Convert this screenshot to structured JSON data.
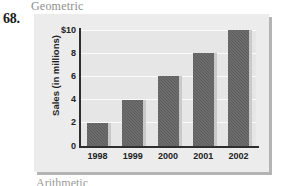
{
  "page": {
    "header_word": "Geometric",
    "footer_word": "Arithmetic",
    "problem_number": "68."
  },
  "chart_data": {
    "type": "bar",
    "title": "",
    "xlabel": "",
    "ylabel": "Sales (in millions)",
    "categories": [
      "1998",
      "1999",
      "2000",
      "2001",
      "2002"
    ],
    "values": [
      2,
      4,
      6,
      8,
      10
    ],
    "ylim": [
      0,
      10
    ],
    "ytick_values": [
      0,
      2,
      4,
      6,
      8,
      10
    ],
    "ytick_labels": [
      "0",
      "2",
      "4",
      "6",
      "8",
      "$10"
    ],
    "grid": true,
    "legend": null,
    "colors": {
      "bar_fill": "#5c5c5c",
      "bar_shadow": "#c9c9c9",
      "panel_background": "#ececec",
      "plot_background": "#e6e6e6",
      "gridline": "#fbfbfb",
      "axis": "#2e2e2e",
      "panel_drop_shadow": "#b4b4b4"
    }
  }
}
